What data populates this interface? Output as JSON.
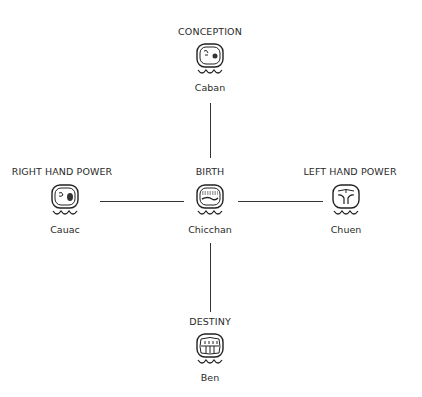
{
  "diagram": {
    "nodes": [
      {
        "id": "conception",
        "role": "CONCEPTION",
        "day_sign": "Caban",
        "icon": "caban-glyph-icon"
      },
      {
        "id": "birth",
        "role": "BIRTH",
        "day_sign": "Chicchan",
        "icon": "chicchan-glyph-icon"
      },
      {
        "id": "right",
        "role": "RIGHT HAND POWER",
        "day_sign": "Cauac",
        "icon": "cauac-glyph-icon"
      },
      {
        "id": "left",
        "role": "LEFT HAND POWER",
        "day_sign": "Chuen",
        "icon": "chuen-glyph-icon"
      },
      {
        "id": "destiny",
        "role": "DESTINY",
        "day_sign": "Ben",
        "icon": "ben-glyph-icon"
      }
    ],
    "edges": [
      {
        "from": "conception",
        "to": "birth"
      },
      {
        "from": "right",
        "to": "birth"
      },
      {
        "from": "birth",
        "to": "left"
      },
      {
        "from": "birth",
        "to": "destiny"
      }
    ],
    "colors": {
      "line": "#333333",
      "text": "#2a2a2a",
      "background": "#ffffff"
    }
  }
}
